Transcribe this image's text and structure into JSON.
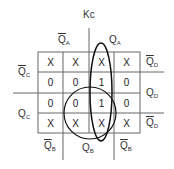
{
  "title": "Kc",
  "col_labels_top": [
    {
      "text": "Q",
      "sub": "A",
      "bar": true
    },
    {
      "text": "Q",
      "sub": "A",
      "bar": false
    }
  ],
  "col_labels_bottom": [
    {
      "text": "Q",
      "sub": "B",
      "bar": true
    },
    {
      "text": "Q",
      "sub": "B",
      "bar": false
    },
    {
      "text": "Q",
      "sub": "B",
      "bar": true
    }
  ],
  "row_labels_left": [
    {
      "text": "Q",
      "sub": "C",
      "bar": true
    },
    {
      "text": "Q",
      "sub": "C",
      "bar": false
    }
  ],
  "row_labels_right": [
    {
      "text": "Q",
      "sub": "D",
      "bar": true
    },
    {
      "text": "Q",
      "sub": "D",
      "bar": false
    },
    {
      "text": "Q",
      "sub": "D",
      "bar": true
    }
  ],
  "cells": [
    [
      "X",
      "X",
      "X",
      "X"
    ],
    [
      "0",
      "0",
      "1",
      "0"
    ],
    [
      "0",
      "0",
      "1",
      "0"
    ],
    [
      "X",
      "X",
      "X",
      "X"
    ]
  ],
  "groupings": [
    {
      "shape": "ellipse",
      "covers": "column 3 all rows"
    },
    {
      "shape": "circle",
      "covers": "rows 3-4, columns 2-3"
    }
  ]
}
